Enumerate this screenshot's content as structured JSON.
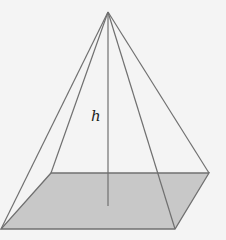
{
  "diagram": {
    "type": "square-pyramid",
    "height_label": "h",
    "colors": {
      "background": "#f4f4f4",
      "base_fill": "#c8c8c8",
      "edge": "#707070"
    }
  }
}
